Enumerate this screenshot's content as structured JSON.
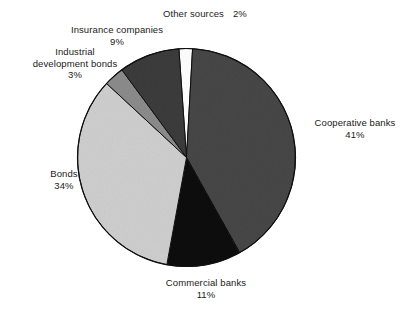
{
  "chart_data": {
    "type": "pie",
    "title": "",
    "subtitle": "",
    "xlabel": "",
    "ylabel": "",
    "legend_position": "none",
    "grid": false,
    "units": "percent",
    "total": 100,
    "start_angle_deg": -4,
    "direction": "clockwise",
    "categories": [
      "Other sources",
      "Cooperative banks",
      "Commercial banks",
      "Bonds",
      "Industrial development bonds",
      "Insurance companies"
    ],
    "values": [
      2,
      41,
      11,
      34,
      3,
      9
    ],
    "slices": [
      {
        "label": "Other sources",
        "value": 2,
        "pct_text": "2%",
        "color": "#ffffff"
      },
      {
        "label": "Cooperative banks",
        "value": 41,
        "pct_text": "41%",
        "color": "#474747"
      },
      {
        "label": "Commercial banks",
        "value": 11,
        "pct_text": "11%",
        "color": "#111111"
      },
      {
        "label": "Bonds",
        "value": 34,
        "pct_text": "34%",
        "color": "#cfcfcf"
      },
      {
        "label": "Industrial development bonds",
        "value": 3,
        "pct_text": "3%",
        "color": "#8c8c8c"
      },
      {
        "label": "Insurance companies",
        "value": 9,
        "pct_text": "9%",
        "color": "#3b3b3b"
      }
    ]
  },
  "labels": {
    "other_sources": {
      "name": "Other sources",
      "pct": "2%"
    },
    "insurance": {
      "name": "Insurance companies",
      "pct": "9%"
    },
    "industrial": {
      "name_line1": "Industrial",
      "name_line2": "development bonds",
      "pct": "3%"
    },
    "bonds": {
      "name": "Bonds",
      "pct": "34%"
    },
    "cooperative": {
      "name": "Cooperative banks",
      "pct": "41%"
    },
    "commercial": {
      "name": "Commercial banks",
      "pct": "11%"
    }
  },
  "colors": {
    "background": "#ffffff",
    "text": "#1a1a1a",
    "outline": "#101010"
  }
}
